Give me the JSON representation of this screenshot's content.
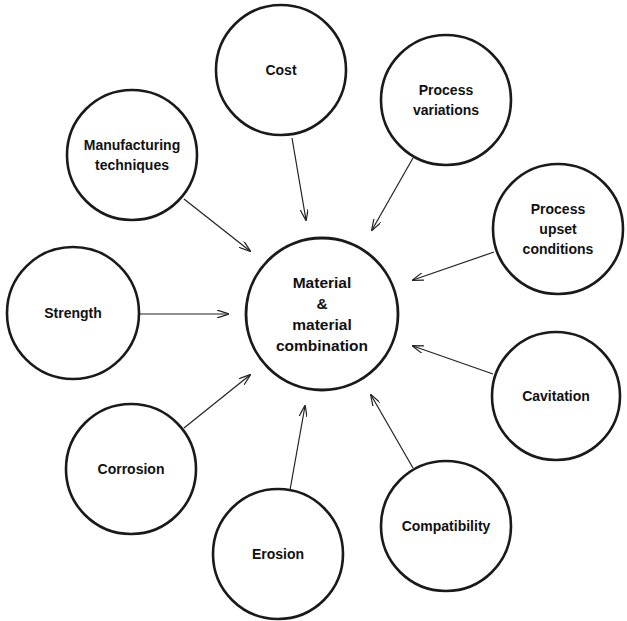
{
  "diagram": {
    "type": "radial-influence",
    "center": {
      "id": "material",
      "lines": [
        "Material",
        "&",
        "material",
        "combination"
      ],
      "cx": 322,
      "cy": 314,
      "r": 76
    },
    "nodes": [
      {
        "id": "cost",
        "lines": [
          "Cost"
        ],
        "cx": 281,
        "cy": 70,
        "r": 65,
        "arrow": [
          292,
          138,
          306,
          220
        ]
      },
      {
        "id": "process-variations",
        "lines": [
          "Process",
          "variations"
        ],
        "cx": 446,
        "cy": 100,
        "r": 65,
        "arrow": [
          413,
          158,
          372,
          230
        ]
      },
      {
        "id": "manufacturing-techniques",
        "lines": [
          "Manufacturing",
          "techniques"
        ],
        "cx": 132,
        "cy": 155,
        "r": 65,
        "arrow": [
          184,
          199,
          250,
          251
        ]
      },
      {
        "id": "process-upset-conditions",
        "lines": [
          "Process",
          "upset",
          "conditions"
        ],
        "cx": 558,
        "cy": 229,
        "r": 65,
        "arrow": [
          494,
          252,
          413,
          280
        ]
      },
      {
        "id": "strength",
        "lines": [
          "Strength"
        ],
        "cx": 73,
        "cy": 313,
        "r": 66,
        "arrow": [
          139,
          314,
          228,
          314
        ]
      },
      {
        "id": "cavitation",
        "lines": [
          "Cavitation"
        ],
        "cx": 556,
        "cy": 396,
        "r": 64,
        "arrow": [
          493,
          374,
          413,
          346
        ]
      },
      {
        "id": "corrosion",
        "lines": [
          "Corrosion"
        ],
        "cx": 131,
        "cy": 469,
        "r": 65,
        "arrow": [
          184,
          428,
          250,
          375
        ]
      },
      {
        "id": "compatibility",
        "lines": [
          "Compatibility"
        ],
        "cx": 446,
        "cy": 526,
        "r": 65,
        "arrow": [
          413,
          468,
          371,
          395
        ]
      },
      {
        "id": "erosion",
        "lines": [
          "Erosion"
        ],
        "cx": 278,
        "cy": 554,
        "r": 65,
        "arrow": [
          290,
          490,
          305,
          406
        ]
      }
    ],
    "colors": {
      "stroke": "#1a1a1a",
      "background": "#ffffff",
      "text": "#111111"
    }
  }
}
